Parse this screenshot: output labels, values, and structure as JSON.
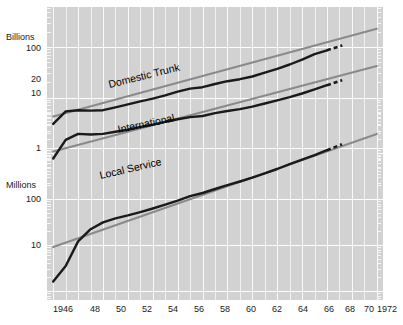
{
  "chart_data": {
    "type": "line",
    "title": "",
    "xlabel": "",
    "ylabel": "",
    "scale": "log",
    "grid": true,
    "legend_position": "inline-annotations",
    "x": [
      1946,
      1947,
      1948,
      1949,
      1950,
      1951,
      1952,
      1953,
      1954,
      1955,
      1956,
      1957,
      1958,
      1959,
      1960,
      1961,
      1962,
      1963,
      1964,
      1965,
      1966,
      1967,
      1968,
      1969,
      1970,
      1971,
      1972
    ],
    "xlim": [
      1945.5,
      1972.5
    ],
    "x_tick_labels": [
      "1946",
      "48",
      "50",
      "52",
      "54",
      "56",
      "58",
      "60",
      "62",
      "64",
      "66",
      "68",
      "70",
      "1972"
    ],
    "x_tick_values": [
      1946,
      1948,
      1950,
      1952,
      1954,
      1956,
      1958,
      1960,
      1962,
      1964,
      1966,
      1968,
      1970,
      1972
    ],
    "upper_axis": {
      "unit": "Billions",
      "tick_labels": [
        "100",
        "20",
        "10",
        "1"
      ],
      "tick_values": [
        100,
        20,
        10,
        1
      ]
    },
    "lower_axis": {
      "unit": "Millions",
      "tick_labels": [
        "100",
        "10"
      ],
      "tick_values": [
        100,
        10
      ]
    },
    "series": [
      {
        "name": "Domestic Trunk",
        "label": "Domestic Trunk",
        "unit": "Billions",
        "color": "#1a1a1a",
        "values": [
          3.0,
          5.3,
          5.6,
          5.5,
          5.6,
          6.4,
          7.3,
          8.4,
          9.5,
          11.0,
          13.0,
          15.0,
          16.0,
          18.5,
          21.0,
          23.0,
          26.0,
          31.0,
          37.0,
          45.0,
          56.0,
          72.0,
          86.0,
          null,
          null,
          null,
          null
        ],
        "projection": {
          "x": [
            1968.4,
            1969.4
          ],
          "note": "dashed projection"
        },
        "trend": {
          "type": "straight-line-fit",
          "color": "#8a8a8a",
          "x": [
            1946,
            1972
          ],
          "values": [
            4.2,
            230
          ]
        }
      },
      {
        "name": "International",
        "label": "International",
        "unit": "Billions",
        "color": "#1a1a1a",
        "values": [
          0.62,
          1.45,
          1.9,
          1.85,
          1.9,
          2.1,
          2.3,
          2.6,
          2.9,
          3.3,
          3.7,
          4.1,
          4.3,
          4.9,
          5.4,
          5.9,
          6.6,
          7.6,
          8.8,
          10.2,
          12.0,
          14.5,
          17.5,
          null,
          null,
          null,
          null
        ],
        "projection": {
          "x": [
            1968.4,
            1969.4
          ],
          "note": "dashed projection"
        },
        "trend": {
          "type": "straight-line-fit",
          "color": "#8a8a8a",
          "x": [
            1946,
            1972
          ],
          "values": [
            0.85,
            42
          ]
        }
      },
      {
        "name": "Local Service",
        "label": "Local Service",
        "unit": "Millions",
        "color": "#1a1a1a",
        "values": [
          1.6,
          3.5,
          12.0,
          22.0,
          31.0,
          38.0,
          44.0,
          52.0,
          62.0,
          75.0,
          92.0,
          115.0,
          135.0,
          165.0,
          200.0,
          240.0,
          290.0,
          360.0,
          450.0,
          570.0,
          720.0,
          900.0,
          1150.0,
          null,
          null,
          null,
          null
        ],
        "projection": {
          "x": [
            1968.4,
            1969.4
          ],
          "note": "dashed projection"
        },
        "trend": {
          "type": "straight-line-fit",
          "color": "#8a8a8a",
          "x": [
            1946,
            1972
          ],
          "values": [
            9.0,
            2600
          ]
        }
      }
    ]
  },
  "axis": {
    "billions_unit": "Billions",
    "billions_100": "100",
    "billions_20": "20",
    "billions_10": "10",
    "billions_1": "1",
    "millions_unit": "Millions",
    "millions_100": "100",
    "millions_10": "10"
  },
  "xaxis": {
    "t0": "1946",
    "t1": "48",
    "t2": "50",
    "t3": "52",
    "t4": "54",
    "t5": "56",
    "t6": "58",
    "t7": "60",
    "t8": "62",
    "t9": "64",
    "t10": "66",
    "t11": "68",
    "t12": "70",
    "t13": "1972"
  },
  "labels": {
    "domestic_trunk": "Domestic Trunk",
    "international": "International",
    "local_service": "Local Service"
  },
  "colors": {
    "plot_background": "#d2d2d2",
    "gridline": "#f4f4f4",
    "series_line": "#1a1a1a",
    "trend_line": "#8a8a8a",
    "text": "#1a1a1a"
  }
}
